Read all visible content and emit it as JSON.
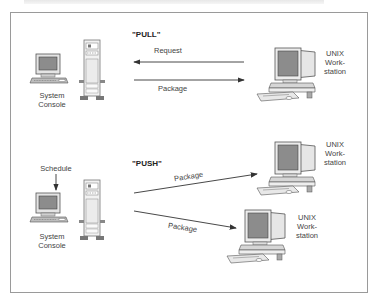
{
  "diagram": {
    "pull": {
      "mode_label": "\"PULL\"",
      "console_label_line1": "System",
      "console_label_line2": "Console",
      "request_label": "Request",
      "package_label": "Package",
      "workstation_label_line1": "UNIX",
      "workstation_label_line2": "Work-",
      "workstation_label_line3": "station"
    },
    "push": {
      "mode_label": "\"PUSH\"",
      "schedule_label": "Schedule",
      "console_label_line1": "System",
      "console_label_line2": "Console",
      "package_label_1": "Package",
      "package_label_2": "Package",
      "workstation1_label_line1": "UNIX",
      "workstation1_label_line2": "Work-",
      "workstation1_label_line3": "station",
      "workstation2_label_line1": "UNIX",
      "workstation2_label_line2": "Work-",
      "workstation2_label_line3": "station"
    },
    "colors": {
      "line": "#333333",
      "screen": "#8c8c8c",
      "frame_border": "#9a9a9a"
    }
  }
}
